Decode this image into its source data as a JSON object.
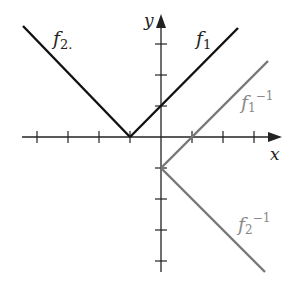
{
  "diagram": {
    "axes": {
      "x_label": "x",
      "y_label": "y",
      "origin_px": [
        161,
        137
      ],
      "unit_px": 31,
      "x_ticks": [
        -4,
        -3,
        -2,
        -1,
        1,
        2,
        3
      ],
      "y_ticks": [
        3,
        2,
        1,
        -1,
        -2,
        -3,
        -4
      ]
    },
    "curves": [
      {
        "id": "f1",
        "label": "f",
        "subscript": "1",
        "superscript": "",
        "color": "#111111",
        "description": "y = x + 1 for x >= -1"
      },
      {
        "id": "f2",
        "label": "f",
        "subscript": "2.",
        "superscript": "",
        "color": "#111111",
        "description": "y = -(x + 1) for x <= -1"
      },
      {
        "id": "f1inv",
        "label": "f",
        "subscript": "1",
        "superscript": "−1",
        "color": "#777777",
        "description": "y = x - 1 for x >= 0"
      },
      {
        "id": "f2inv",
        "label": "f",
        "subscript": "2",
        "superscript": "−1",
        "color": "#777777",
        "description": "y = -x - 1 for x >= 0"
      }
    ]
  }
}
